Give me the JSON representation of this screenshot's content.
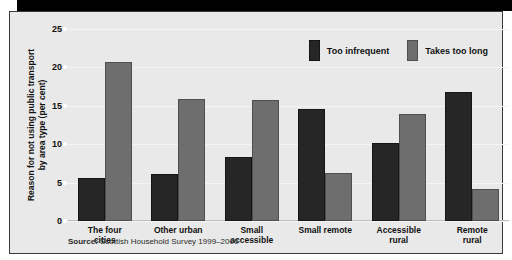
{
  "chart_data": {
    "type": "bar",
    "title": "",
    "xlabel": "",
    "ylabel": "Reason for not using public transport by area type (per cent)",
    "ylabel_line1": "Reason for not using public transport",
    "ylabel_line2": "by area type (per cent)",
    "ylim": [
      0,
      25
    ],
    "yticks": [
      0,
      5,
      10,
      15,
      20,
      25
    ],
    "ytick_labels": [
      "0",
      "5",
      "10",
      "15",
      "20",
      "25"
    ],
    "grid": true,
    "legend_position": "top-right",
    "categories": [
      "The four cities",
      "Other urban",
      "Small accessible",
      "Small remote",
      "Accessible rural",
      "Remote rural"
    ],
    "category_lines": [
      [
        "The four",
        "cities"
      ],
      [
        "Other urban"
      ],
      [
        "Small",
        "accessible"
      ],
      [
        "Small remote"
      ],
      [
        "Accessible",
        "rural"
      ],
      [
        "Remote",
        "rural"
      ]
    ],
    "series": [
      {
        "name": "Too infrequent",
        "color": "#262626",
        "values": [
          5.6,
          6.1,
          8.4,
          14.6,
          10.2,
          16.8
        ]
      },
      {
        "name": "Takes too long",
        "color": "#6e6e6e",
        "values": [
          20.7,
          15.9,
          15.8,
          6.2,
          13.9,
          4.2
        ]
      }
    ]
  },
  "legend": {
    "items": [
      {
        "label": "Too infrequent",
        "color": "#262626"
      },
      {
        "label": "Takes too long",
        "color": "#6e6e6e"
      }
    ]
  },
  "source": {
    "prefix": "Source:",
    "text": "Scottish Household Survey 1999–2000"
  },
  "colors": {
    "series_dark": "#262626",
    "series_grey": "#6e6e6e",
    "plot_background": "#e9e9e9",
    "gridline": "#f4f4f4",
    "frame": "#3a3a3a",
    "top_band": "#000000"
  }
}
